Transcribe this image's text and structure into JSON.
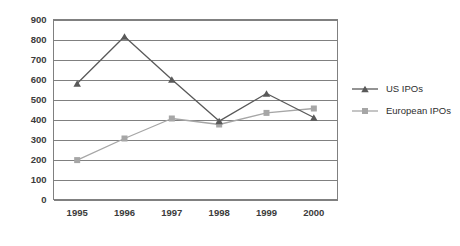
{
  "chart_data": {
    "type": "line",
    "title": "",
    "subtitle": "",
    "xlabel": "",
    "ylabel": "",
    "categories": [
      "1995",
      "1996",
      "1997",
      "1998",
      "1999",
      "2000"
    ],
    "series": [
      {
        "name": "US IPOs",
        "marker": "triangle",
        "color": "#595959",
        "values": [
          580,
          815,
          600,
          392,
          530,
          410
        ]
      },
      {
        "name": "European IPOs",
        "marker": "square",
        "color": "#a6a6a6",
        "values": [
          197,
          305,
          405,
          375,
          433,
          455
        ]
      }
    ],
    "ylim": [
      0,
      900
    ],
    "ytick_values": [
      0,
      100,
      200,
      300,
      400,
      500,
      600,
      700,
      800,
      900
    ],
    "ytick_labels": [
      "0",
      "100",
      "200",
      "300",
      "400",
      "500",
      "600",
      "700",
      "800",
      "900"
    ],
    "xtick_labels": [
      "1995",
      "1996",
      "1997",
      "1998",
      "1999",
      "2000"
    ],
    "grid": {
      "horizontal": true,
      "vertical": false,
      "color": "#808080"
    },
    "legend": {
      "position": "right",
      "entries": [
        {
          "label": "US IPOs",
          "marker": "triangle-icon",
          "color": "#595959"
        },
        {
          "label": "European IPOs",
          "marker": "square-icon",
          "color": "#a6a6a6"
        }
      ]
    },
    "colors": {
      "background": "#ffffff",
      "axis": "#808080",
      "grid": "#808080",
      "text": "#3b3b3b",
      "series_us": "#595959",
      "series_europe": "#a6a6a6"
    }
  }
}
